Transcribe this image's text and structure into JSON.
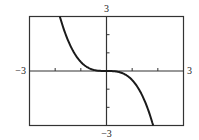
{
  "chart_data": {
    "type": "line",
    "title": "",
    "xlabel": "",
    "ylabel": "",
    "xlim": [
      -3,
      3
    ],
    "ylim": [
      -3,
      3
    ],
    "x_tick_step": 1,
    "y_tick_step": 1,
    "grid": false,
    "legend": null,
    "tick_labels": {
      "x_min": "−3",
      "x_max": "3",
      "y_min": "−3",
      "y_max": "3"
    },
    "series": [
      {
        "name": "f(x) = -x^3/2",
        "function": "-x^3/2",
        "x": [
          -1.82,
          -1.5,
          -1.25,
          -1.0,
          -0.75,
          -0.5,
          -0.25,
          0,
          0.25,
          0.5,
          0.75,
          1.0,
          1.25,
          1.5,
          1.82
        ],
        "values": [
          3.0,
          1.69,
          0.98,
          0.5,
          0.21,
          0.06,
          0.01,
          0,
          -0.01,
          -0.06,
          -0.21,
          -0.5,
          -0.98,
          -1.69,
          -3.0
        ]
      }
    ],
    "colors": {
      "curve": "#1a1a1a",
      "frame": "#333333",
      "axes": "#333333"
    }
  }
}
